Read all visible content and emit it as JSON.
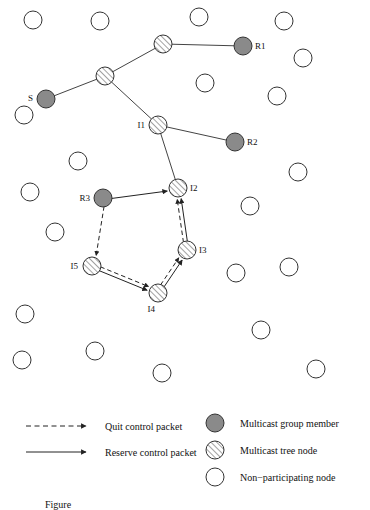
{
  "figure": {
    "caption": "Figure",
    "colors": {
      "member_fill": "#8a8a8a",
      "tree_fill": "#ffffff",
      "tree_hatch": "#8a8a8a",
      "plain_fill": "#ffffff",
      "stroke": "#333333",
      "line": "#444444",
      "text": "#111111"
    }
  },
  "nodes": {
    "members": [
      {
        "id": "S",
        "label": "S",
        "cx": 46,
        "cy": 99,
        "r": 9,
        "label_dx": -13,
        "label_dy": 2
      },
      {
        "id": "R1",
        "label": "R1",
        "cx": 243,
        "cy": 46,
        "r": 9,
        "label_dx": 12,
        "label_dy": 3
      },
      {
        "id": "R2",
        "label": "R2",
        "cx": 235,
        "cy": 142,
        "r": 9,
        "label_dx": 12,
        "label_dy": 3
      },
      {
        "id": "R3",
        "label": "R3",
        "cx": 103,
        "cy": 198,
        "r": 9,
        "label_dx": -13,
        "label_dy": 3
      }
    ],
    "tree": [
      {
        "id": "T1",
        "label": "",
        "cx": 163,
        "cy": 44,
        "r": 9,
        "label_dx": 0,
        "label_dy": 0
      },
      {
        "id": "T2",
        "label": "",
        "cx": 105,
        "cy": 76,
        "r": 9,
        "label_dx": 0,
        "label_dy": 0
      },
      {
        "id": "I1",
        "label": "I1",
        "cx": 158,
        "cy": 125,
        "r": 9,
        "label_dx": -13,
        "label_dy": 3
      },
      {
        "id": "I2",
        "label": "I2",
        "cx": 178,
        "cy": 188,
        "r": 9,
        "label_dx": 12,
        "label_dy": 3
      },
      {
        "id": "I3",
        "label": "I3",
        "cx": 187,
        "cy": 250,
        "r": 9,
        "label_dx": 12,
        "label_dy": 3
      },
      {
        "id": "I4",
        "label": "I4",
        "cx": 158,
        "cy": 293,
        "r": 9,
        "label_dx": -3,
        "label_dy": 19
      },
      {
        "id": "I5",
        "label": "I5",
        "cx": 92,
        "cy": 266,
        "r": 9,
        "label_dx": -14,
        "label_dy": 3
      }
    ],
    "plain": [
      {
        "cx": 33,
        "cy": 20
      },
      {
        "cx": 100,
        "cy": 21
      },
      {
        "cx": 199,
        "cy": 17
      },
      {
        "cx": 284,
        "cy": 21
      },
      {
        "cx": 303,
        "cy": 58
      },
      {
        "cx": 205,
        "cy": 83
      },
      {
        "cx": 277,
        "cy": 96
      },
      {
        "cx": 24,
        "cy": 115
      },
      {
        "cx": 78,
        "cy": 161
      },
      {
        "cx": 298,
        "cy": 172
      },
      {
        "cx": 30,
        "cy": 192
      },
      {
        "cx": 250,
        "cy": 206
      },
      {
        "cx": 55,
        "cy": 232
      },
      {
        "cx": 236,
        "cy": 273
      },
      {
        "cx": 289,
        "cy": 267
      },
      {
        "cx": 25,
        "cy": 314
      },
      {
        "cx": 261,
        "cy": 330
      },
      {
        "cx": 22,
        "cy": 360
      },
      {
        "cx": 95,
        "cy": 351
      },
      {
        "cx": 162,
        "cy": 373
      },
      {
        "cx": 316,
        "cy": 369
      }
    ]
  },
  "edges": {
    "tree_links": [
      {
        "from": "S",
        "to": "T2"
      },
      {
        "from": "T2",
        "to": "T1"
      },
      {
        "from": "T1",
        "to": "R1"
      },
      {
        "from": "T2",
        "to": "I1"
      },
      {
        "from": "I1",
        "to": "R2"
      },
      {
        "from": "I1",
        "to": "I2"
      }
    ],
    "reserve_arrows": [
      {
        "from": "R3",
        "to": "I2",
        "label": "Reserve control packet"
      },
      {
        "from": "I3",
        "to": "I2",
        "label": "Reserve control packet"
      },
      {
        "from": "I4",
        "to": "I3",
        "label": "Reserve control packet"
      },
      {
        "from": "I5",
        "to": "I4",
        "label": "Reserve control packet"
      }
    ],
    "quit_arrows": [
      {
        "from": "R3",
        "to": "I5",
        "label": "Quit control packet"
      },
      {
        "from": "I5",
        "to": "I4",
        "label": "Quit control packet"
      },
      {
        "from": "I4",
        "to": "I3",
        "label": "Quit control packet"
      },
      {
        "from": "I3",
        "to": "I2",
        "label": "Quit control packet"
      }
    ]
  },
  "legend": {
    "lines": [
      {
        "key": "quit",
        "style": "dashed",
        "label": "Quit control packet"
      },
      {
        "key": "reserve",
        "style": "solid",
        "label": "Reserve control packet"
      }
    ],
    "symbols": [
      {
        "key": "member",
        "fill": "member",
        "label": "Multicast group member"
      },
      {
        "key": "tree",
        "fill": "hatch",
        "label": "Multicast tree node"
      },
      {
        "key": "plain",
        "fill": "white",
        "label": "Non−participating node"
      }
    ]
  }
}
